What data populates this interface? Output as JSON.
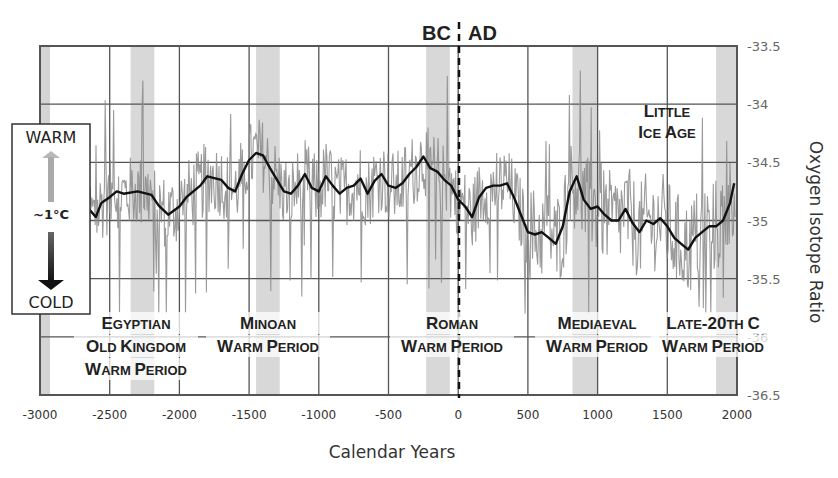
{
  "chart_data": {
    "type": "line",
    "title": "",
    "xlabel": "Calendar Years",
    "ylabel": "Oxygen Isotope Ratio",
    "xlim": [
      -3000,
      2000
    ],
    "ylim": [
      -36.5,
      -33.5
    ],
    "y_axis_position": "right",
    "x_ticks": [
      -3000,
      -2500,
      -2000,
      -1500,
      -1000,
      -500,
      0,
      500,
      1000,
      1500,
      2000
    ],
    "x_tick_labels": [
      "-3000",
      "-2500",
      "-2000",
      "-1500",
      "-1000",
      "-500",
      "0",
      "500",
      "1000",
      "1500",
      "2000"
    ],
    "y_ticks": [
      -33.5,
      -34,
      -34.5,
      -35,
      -35.5,
      -36,
      -36.5
    ],
    "y_tick_labels": [
      "-33.5",
      "-34",
      "-34.5",
      "-35",
      "-35.5",
      "-36",
      "-36.5"
    ],
    "grid": true,
    "era_divider": {
      "x": 0,
      "left_label": "BC",
      "right_label": "AD",
      "style": "dashed"
    },
    "legend_box": {
      "top_label": "WARM",
      "middle_label": "~1°C",
      "bottom_label": "COLD",
      "arrow_up_color": "#aaaaaa",
      "arrow_down_color": "#222222"
    },
    "series": [
      {
        "name": "Smoothed oxygen isotope ratio",
        "style": "thick black line",
        "x": [
          -2720,
          -2650,
          -2600,
          -2560,
          -2500,
          -2450,
          -2400,
          -2300,
          -2200,
          -2150,
          -2080,
          -2000,
          -1950,
          -1850,
          -1800,
          -1700,
          -1650,
          -1600,
          -1550,
          -1500,
          -1450,
          -1400,
          -1350,
          -1300,
          -1250,
          -1200,
          -1150,
          -1100,
          -1050,
          -1000,
          -950,
          -900,
          -850,
          -800,
          -750,
          -700,
          -650,
          -600,
          -550,
          -500,
          -450,
          -400,
          -350,
          -300,
          -250,
          -200,
          -150,
          -100,
          -50,
          0,
          50,
          100,
          150,
          200,
          250,
          300,
          350,
          400,
          450,
          500,
          550,
          600,
          650,
          700,
          750,
          800,
          850,
          900,
          950,
          1000,
          1050,
          1100,
          1150,
          1200,
          1250,
          1300,
          1350,
          1400,
          1450,
          1500,
          1550,
          1600,
          1650,
          1700,
          1750,
          1800,
          1850,
          1900,
          1950,
          1980
        ],
        "values": [
          -34.9,
          -34.9,
          -34.97,
          -34.85,
          -34.8,
          -34.75,
          -34.77,
          -34.75,
          -34.78,
          -34.87,
          -34.95,
          -34.88,
          -34.8,
          -34.7,
          -34.62,
          -34.65,
          -34.72,
          -34.75,
          -34.6,
          -34.48,
          -34.42,
          -34.44,
          -34.55,
          -34.65,
          -34.75,
          -34.77,
          -34.7,
          -34.6,
          -34.72,
          -34.75,
          -34.62,
          -34.7,
          -34.77,
          -34.72,
          -34.7,
          -34.64,
          -34.77,
          -34.66,
          -34.6,
          -34.7,
          -34.72,
          -34.68,
          -34.6,
          -34.54,
          -34.45,
          -34.55,
          -34.58,
          -34.65,
          -34.7,
          -34.82,
          -34.88,
          -34.97,
          -34.8,
          -34.72,
          -34.7,
          -34.7,
          -34.68,
          -34.8,
          -34.95,
          -35.1,
          -35.12,
          -35.1,
          -35.15,
          -35.2,
          -35.05,
          -34.75,
          -34.62,
          -34.82,
          -34.9,
          -34.88,
          -34.95,
          -35.0,
          -35.0,
          -34.9,
          -35.02,
          -35.1,
          -35.0,
          -35.03,
          -34.98,
          -35.05,
          -35.15,
          -35.2,
          -35.25,
          -35.15,
          -35.1,
          -35.05,
          -35.05,
          -35.0,
          -34.85,
          -34.68
        ]
      },
      {
        "name": "Annual oxygen isotope ratio",
        "style": "thin gray noisy line",
        "range_min": -35.8,
        "range_max": -33.7
      }
    ],
    "shaded_periods": [
      {
        "label_lines": [
          "Egyptian",
          "Old Kingdom",
          "Warm Period"
        ],
        "x_start": -2350,
        "x_end": -2180
      },
      {
        "label_lines": [
          "Minoan",
          "Warm Period"
        ],
        "x_start": -1450,
        "x_end": -1280
      },
      {
        "label_lines": [
          "Roman",
          "Warm Period"
        ],
        "x_start": -230,
        "x_end": -60
      },
      {
        "label_lines": [
          "Mediaeval",
          "Warm Period"
        ],
        "x_start": 820,
        "x_end": 1000
      },
      {
        "label_lines": [
          "Late-20th C",
          "Warm Period"
        ],
        "x_start": 1850,
        "x_end": 2000
      }
    ],
    "annotations": [
      {
        "text_lines": [
          "Little",
          "Ice Age"
        ],
        "x": 1500,
        "y": -34.1
      }
    ]
  },
  "labels": {
    "bc": "BC",
    "ad": "AD",
    "xlabel": "Calendar Years",
    "ylabel": "Oxygen Isotope Ratio",
    "legend_warm": "WARM",
    "legend_mid": "~1°C",
    "legend_cold": "COLD",
    "little_ice_age": [
      "Little",
      "Ice Age"
    ],
    "egyptian": [
      "Egyptian",
      "Old Kingdom",
      "Warm Period"
    ],
    "minoan": [
      "Minoan",
      "Warm Period"
    ],
    "roman": [
      "Roman",
      "Warm Period"
    ],
    "mediaeval": [
      "Mediaeval",
      "Warm Period"
    ],
    "late20": [
      "Late-20th C",
      "Warm Period"
    ]
  }
}
